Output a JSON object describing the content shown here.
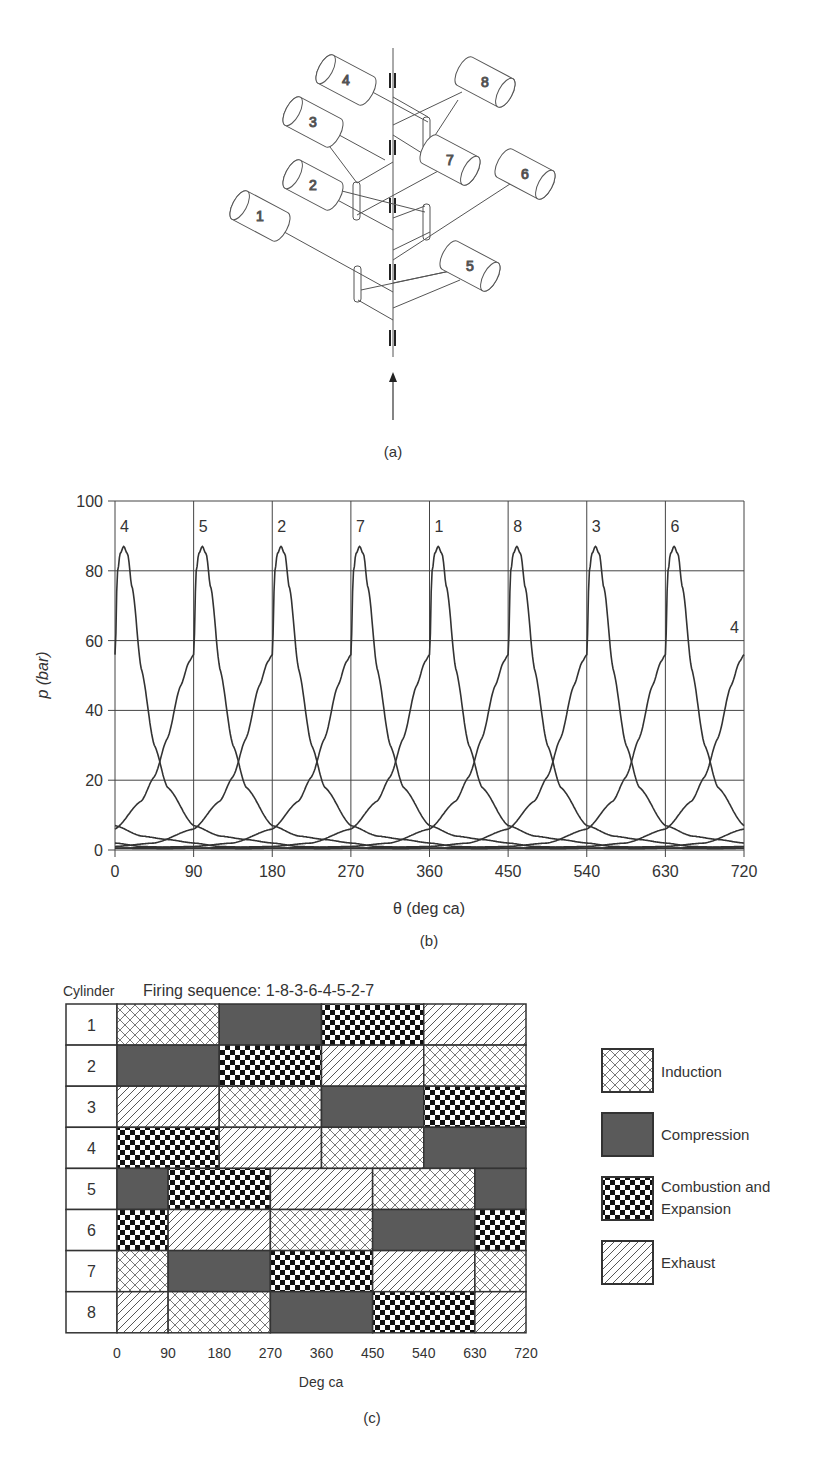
{
  "panel_a": {
    "label": "(a)",
    "cylinders": [
      {
        "id": "1",
        "cx": 260,
        "cy": 216,
        "side": "left"
      },
      {
        "id": "2",
        "cx": 313,
        "cy": 185,
        "side": "left"
      },
      {
        "id": "3",
        "cx": 313,
        "cy": 122,
        "side": "left"
      },
      {
        "id": "4",
        "cx": 346,
        "cy": 80,
        "side": "left"
      },
      {
        "id": "5",
        "cx": 470,
        "cy": 266,
        "side": "right"
      },
      {
        "id": "6",
        "cx": 525,
        "cy": 174,
        "side": "right"
      },
      {
        "id": "7",
        "cx": 450,
        "cy": 160,
        "side": "right"
      },
      {
        "id": "8",
        "cx": 485,
        "cy": 82,
        "side": "right"
      }
    ]
  },
  "chart_data": [
    {
      "type": "line",
      "panel_label": "(b)",
      "title": "",
      "xlabel": "θ (deg ca)",
      "ylabel": "p (bar)",
      "x_ticks": [
        0,
        90,
        180,
        270,
        360,
        450,
        540,
        630,
        720
      ],
      "y_ticks": [
        0,
        20,
        40,
        60,
        80,
        100
      ],
      "xlim": [
        0,
        720
      ],
      "ylim": [
        0,
        100
      ],
      "grid": true,
      "peak_pressure_bar": 87,
      "peak_offset_deg": 10,
      "pressure_at_tdc_bar": 56,
      "series": [
        {
          "name": "4",
          "tdc_deg": 0
        },
        {
          "name": "5",
          "tdc_deg": 90
        },
        {
          "name": "2",
          "tdc_deg": 180
        },
        {
          "name": "7",
          "tdc_deg": 270
        },
        {
          "name": "1",
          "tdc_deg": 360
        },
        {
          "name": "8",
          "tdc_deg": 450
        },
        {
          "name": "3",
          "tdc_deg": 540
        },
        {
          "name": "6",
          "tdc_deg": 630
        },
        {
          "name": "4",
          "tdc_deg": 720
        }
      ],
      "profile": {
        "offset_deg": [
          -270,
          -180,
          -135,
          -90,
          -60,
          -45,
          -30,
          -15,
          -5,
          0,
          3,
          6,
          10,
          14,
          20,
          30,
          45,
          60,
          90,
          120,
          150,
          180,
          210,
          270,
          330,
          360,
          450
        ],
        "pressure_bar": [
          0.5,
          1,
          2,
          6,
          14,
          21,
          32,
          47,
          54,
          56,
          80,
          85,
          87,
          85,
          75,
          52,
          30,
          18,
          7,
          4,
          3,
          2,
          1,
          0.5,
          0.4,
          0.5,
          0.5
        ]
      }
    },
    {
      "type": "table",
      "panel_label": "(c)",
      "title": "Firing sequence: 1-8-3-6-4-5-2-7",
      "row_header": "Cylinder",
      "xlabel": "Deg ca",
      "x_ticks": [
        0,
        90,
        180,
        270,
        360,
        450,
        540,
        630,
        720
      ],
      "legend": [
        {
          "key": "induction",
          "label": "Induction"
        },
        {
          "key": "compression",
          "label": "Compression"
        },
        {
          "key": "combustion",
          "label_line1": "Combustion and",
          "label_line2": "Expansion"
        },
        {
          "key": "exhaust",
          "label": "Exhaust"
        }
      ],
      "rows": [
        {
          "cylinder": "1",
          "segments": [
            [
              0,
              180,
              "induction"
            ],
            [
              180,
              360,
              "compression"
            ],
            [
              360,
              540,
              "combustion"
            ],
            [
              540,
              720,
              "exhaust"
            ]
          ]
        },
        {
          "cylinder": "2",
          "segments": [
            [
              0,
              180,
              "compression"
            ],
            [
              180,
              360,
              "combustion"
            ],
            [
              360,
              540,
              "exhaust"
            ],
            [
              540,
              720,
              "induction"
            ]
          ]
        },
        {
          "cylinder": "3",
          "segments": [
            [
              0,
              180,
              "exhaust"
            ],
            [
              180,
              360,
              "induction"
            ],
            [
              360,
              540,
              "compression"
            ],
            [
              540,
              720,
              "combustion"
            ]
          ]
        },
        {
          "cylinder": "4",
          "segments": [
            [
              0,
              180,
              "combustion"
            ],
            [
              180,
              360,
              "exhaust"
            ],
            [
              360,
              540,
              "induction"
            ],
            [
              540,
              720,
              "compression"
            ]
          ]
        },
        {
          "cylinder": "5",
          "segments": [
            [
              0,
              90,
              "compression"
            ],
            [
              90,
              270,
              "combustion"
            ],
            [
              270,
              450,
              "exhaust"
            ],
            [
              450,
              630,
              "induction"
            ],
            [
              630,
              720,
              "compression"
            ]
          ]
        },
        {
          "cylinder": "6",
          "segments": [
            [
              0,
              90,
              "combustion"
            ],
            [
              90,
              270,
              "exhaust"
            ],
            [
              270,
              450,
              "induction"
            ],
            [
              450,
              630,
              "compression"
            ],
            [
              630,
              720,
              "combustion"
            ]
          ]
        },
        {
          "cylinder": "7",
          "segments": [
            [
              0,
              90,
              "induction"
            ],
            [
              90,
              270,
              "compression"
            ],
            [
              270,
              450,
              "combustion"
            ],
            [
              450,
              630,
              "exhaust"
            ],
            [
              630,
              720,
              "induction"
            ]
          ]
        },
        {
          "cylinder": "8",
          "segments": [
            [
              0,
              90,
              "exhaust"
            ],
            [
              90,
              270,
              "induction"
            ],
            [
              270,
              450,
              "compression"
            ],
            [
              450,
              630,
              "combustion"
            ],
            [
              630,
              720,
              "exhaust"
            ]
          ]
        }
      ]
    }
  ],
  "labels": {
    "panel_a": "(a)",
    "panel_b": "(b)",
    "panel_c": "(c)",
    "b_xlabel": "θ (deg ca)",
    "b_ylabel": "p (bar)",
    "c_row_header": "Cylinder",
    "c_title": "Firing sequence: 1-8-3-6-4-5-2-7",
    "c_xlabel": "Deg ca",
    "legend_induction": "Induction",
    "legend_compression": "Compression",
    "legend_combustion_1": "Combustion and",
    "legend_combustion_2": "Expansion",
    "legend_exhaust": "Exhaust"
  },
  "colors": {
    "ink": "#333333",
    "compression_fill": "#5a5a5a",
    "grid": "#444444"
  }
}
